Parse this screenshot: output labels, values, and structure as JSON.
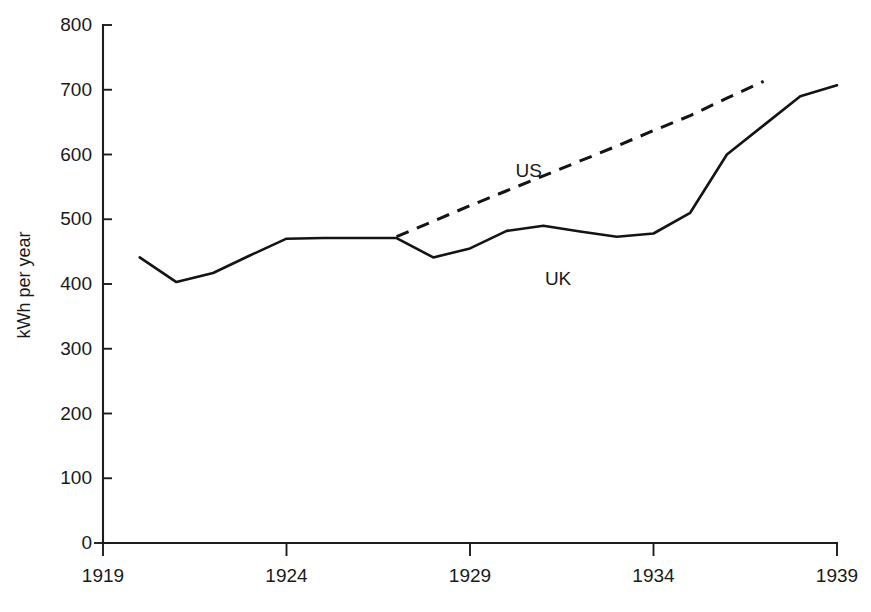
{
  "chart_data": {
    "type": "line",
    "title": "",
    "subtitle": "",
    "xlabel": "",
    "ylabel": "kWh per year",
    "xlim": [
      1919,
      1939
    ],
    "ylim": [
      0,
      800
    ],
    "grid": false,
    "legend_position": "inline-annotation",
    "x_ticks": [
      "1919",
      "1924",
      "1929",
      "1934",
      "1939"
    ],
    "x_tick_values": [
      1919,
      1924,
      1929,
      1934,
      1939
    ],
    "y_ticks": [
      "0",
      "100",
      "200",
      "300",
      "400",
      "500",
      "600",
      "700",
      "800"
    ],
    "y_tick_values": [
      0,
      100,
      200,
      300,
      400,
      500,
      600,
      700,
      800
    ],
    "annotations": [
      {
        "text": "US",
        "x": 1930.6,
        "y": 565
      },
      {
        "text": "UK",
        "x": 1931.4,
        "y": 398
      }
    ],
    "series": [
      {
        "name": "UK",
        "style": "solid",
        "color": "#141414",
        "x": [
          1920,
          1921,
          1922,
          1923,
          1924,
          1925,
          1926,
          1927,
          1928,
          1929,
          1930,
          1931,
          1932,
          1933,
          1934,
          1935,
          1936,
          1937,
          1938,
          1939
        ],
        "values": [
          441,
          403,
          417,
          444,
          470,
          471,
          471,
          471,
          441,
          455,
          482,
          490,
          481,
          473,
          478,
          510,
          600,
          645,
          690,
          707
        ]
      },
      {
        "name": "US",
        "style": "dashed",
        "color": "#141414",
        "x": [
          1927,
          1928,
          1929,
          1930,
          1931,
          1932,
          1933,
          1934,
          1935,
          1936,
          1937
        ],
        "values": [
          473,
          497,
          521,
          544,
          567,
          590,
          613,
          637,
          660,
          687,
          713
        ]
      }
    ]
  },
  "axes_labels": {
    "y_title": "kWh per year"
  }
}
